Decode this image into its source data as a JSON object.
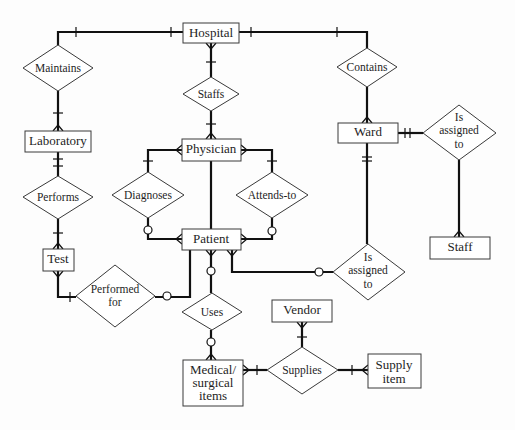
{
  "diagram": {
    "type": "entity-relationship",
    "notation": "crow's foot",
    "entities": [
      {
        "id": "hospital",
        "label": "Hospital"
      },
      {
        "id": "laboratory",
        "label": "Laboratory"
      },
      {
        "id": "physician",
        "label": "Physician"
      },
      {
        "id": "ward",
        "label": "Ward"
      },
      {
        "id": "patient",
        "label": "Patient"
      },
      {
        "id": "test",
        "label": "Test"
      },
      {
        "id": "staff",
        "label": "Staff"
      },
      {
        "id": "vendor",
        "label": "Vendor"
      },
      {
        "id": "medical",
        "label_lines": [
          "Medical/",
          "surgical",
          "items"
        ]
      },
      {
        "id": "supply",
        "label_lines": [
          "Supply",
          "item"
        ]
      }
    ],
    "relationships": [
      {
        "id": "maintains",
        "label": "Maintains",
        "connects": [
          "hospital",
          "laboratory"
        ]
      },
      {
        "id": "staffs",
        "label": "Staffs",
        "connects": [
          "hospital",
          "physician"
        ]
      },
      {
        "id": "contains",
        "label": "Contains",
        "connects": [
          "hospital",
          "ward"
        ]
      },
      {
        "id": "performs",
        "label": "Performs",
        "connects": [
          "laboratory",
          "test"
        ]
      },
      {
        "id": "diagnoses",
        "label": "Diagnoses",
        "connects": [
          "physician",
          "patient"
        ]
      },
      {
        "id": "attends",
        "label": "Attends-to",
        "connects": [
          "physician",
          "patient"
        ]
      },
      {
        "id": "ward_staff",
        "label_lines": [
          "Is",
          "assigned",
          "to"
        ],
        "connects": [
          "ward",
          "staff"
        ]
      },
      {
        "id": "patient_ward",
        "label_lines": [
          "Is",
          "assigned",
          "to"
        ],
        "connects": [
          "patient",
          "ward"
        ]
      },
      {
        "id": "performed_for",
        "label_lines": [
          "Performed",
          "for"
        ],
        "connects": [
          "test",
          "patient"
        ]
      },
      {
        "id": "uses",
        "label": "Uses",
        "connects": [
          "patient",
          "medical"
        ]
      },
      {
        "id": "supplies",
        "label": "Supplies",
        "connects": [
          "vendor",
          "medical",
          "supply"
        ]
      }
    ]
  }
}
